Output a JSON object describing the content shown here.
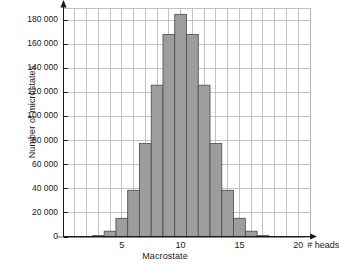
{
  "chart_data": {
    "type": "bar",
    "title": "",
    "xlabel": "Macrostate",
    "ylabel": "Number of microstates",
    "x_unit_label": "# heads",
    "grid": true,
    "legend": "none",
    "xlim": [
      0,
      21
    ],
    "ylim": [
      0,
      190000
    ],
    "x_tick_labels": [
      "5",
      "10",
      "15",
      "20"
    ],
    "x_tick_values": [
      5,
      10,
      15,
      20
    ],
    "y_tick_labels": [
      "0",
      "20 000",
      "40 000",
      "60 000",
      "80 000",
      "100 000",
      "120 000",
      "140 000",
      "160 000",
      "180 000"
    ],
    "y_tick_values": [
      0,
      20000,
      40000,
      60000,
      80000,
      100000,
      120000,
      140000,
      160000,
      180000
    ],
    "bar_fill_color": "#9d9d9d",
    "bar_edge_color": "#4a4a4a",
    "grid_color": "#b4b4b4",
    "axis_color": "#1a1a1a",
    "categories": [
      0,
      1,
      2,
      3,
      4,
      5,
      6,
      7,
      8,
      9,
      10,
      11,
      12,
      13,
      14,
      15,
      16,
      17,
      18,
      19,
      20
    ],
    "values": [
      1,
      20,
      190,
      1140,
      4845,
      15504,
      38760,
      77520,
      125970,
      167960,
      184756,
      167960,
      125970,
      77520,
      38760,
      15504,
      4845,
      1140,
      190,
      20,
      1
    ]
  }
}
